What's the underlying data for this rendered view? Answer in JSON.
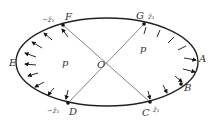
{
  "diagram": {
    "type": "ellipse-pressure-diagram",
    "colors": {
      "curve": "#222222",
      "line": "#555555",
      "text": "#333333",
      "background": "#ffffff"
    },
    "points": {
      "A": "A",
      "B": "B",
      "C": "C",
      "D": "D",
      "E": "E",
      "F": "F",
      "G": "G",
      "O": "O"
    },
    "region_labels": {
      "left": "p",
      "right": "p"
    },
    "z_labels": {
      "F": "−z̄₁",
      "G": "z̄₁",
      "D": "−z̄₁",
      "C": "z̄₁"
    },
    "lines": [
      {
        "from": "F",
        "to": "C"
      },
      {
        "from": "G",
        "to": "D"
      }
    ],
    "arrows": {
      "direction": "inward",
      "arcs": [
        "F-E-D",
        "G-A-B-C"
      ]
    }
  }
}
